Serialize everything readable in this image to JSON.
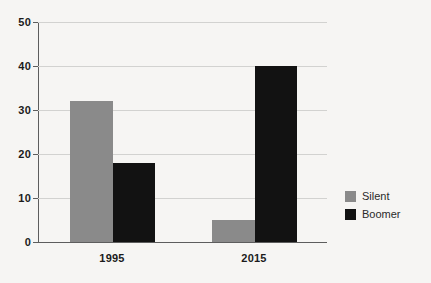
{
  "chart_data": {
    "type": "bar",
    "title": "",
    "subtitle": "",
    "xlabel": "",
    "ylabel": "",
    "categories": [
      "1995",
      "2015"
    ],
    "series": [
      {
        "name": "Silent",
        "color": "#8a8a8a",
        "values": [
          32,
          5
        ]
      },
      {
        "name": "Boomer",
        "color": "#121212",
        "values": [
          18,
          40
        ]
      }
    ],
    "ylim": [
      0,
      50
    ],
    "ytick_values": [
      0,
      10,
      20,
      30,
      40,
      50
    ],
    "ytick_labels": [
      "0",
      "10",
      "20",
      "30",
      "40",
      "50"
    ],
    "grid": true,
    "grid_axis": "y",
    "legend": true,
    "legend_position": "right",
    "bar_grouping": "grouped",
    "background_color": "#f6f5f3",
    "gridline_color": "#d2d2d0",
    "axis_color": "#5d5d5d",
    "text_color": "#1b1b1b"
  }
}
